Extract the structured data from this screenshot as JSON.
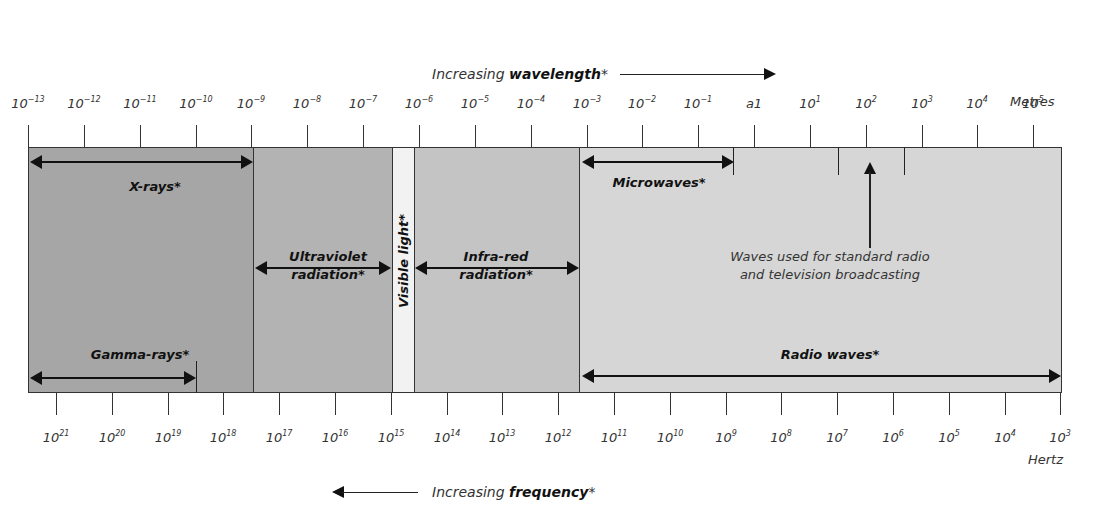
{
  "header": {
    "wavelength_caption_prefix": "Increasing ",
    "wavelength_caption_bold": "wavelength",
    "wavelength_caption_suffix": "*",
    "wavelength_unit": "Metres"
  },
  "footer": {
    "frequency_caption_prefix": "Increasing ",
    "frequency_caption_bold": "frequency",
    "frequency_caption_suffix": "*",
    "frequency_unit": "Hertz"
  },
  "wavelength_ticks": [
    {
      "base": "10",
      "exp": "−13"
    },
    {
      "base": "10",
      "exp": "−12"
    },
    {
      "base": "10",
      "exp": "−11"
    },
    {
      "base": "10",
      "exp": "−10"
    },
    {
      "base": "10",
      "exp": "−9"
    },
    {
      "base": "10",
      "exp": "−8"
    },
    {
      "base": "10",
      "exp": "−7"
    },
    {
      "base": "10",
      "exp": "−6"
    },
    {
      "base": "10",
      "exp": "−5"
    },
    {
      "base": "10",
      "exp": "−4"
    },
    {
      "base": "10",
      "exp": "−3"
    },
    {
      "base": "10",
      "exp": "−2"
    },
    {
      "base": "10",
      "exp": "−1"
    },
    {
      "base": "a1",
      "exp": ""
    },
    {
      "base": "10",
      "exp": "1"
    },
    {
      "base": "10",
      "exp": "2"
    },
    {
      "base": "10",
      "exp": "3"
    },
    {
      "base": "10",
      "exp": "4"
    },
    {
      "base": "10",
      "exp": "5"
    }
  ],
  "frequency_ticks": [
    {
      "base": "10",
      "exp": "21"
    },
    {
      "base": "10",
      "exp": "20"
    },
    {
      "base": "10",
      "exp": "19"
    },
    {
      "base": "10",
      "exp": "18"
    },
    {
      "base": "10",
      "exp": "17"
    },
    {
      "base": "10",
      "exp": "16"
    },
    {
      "base": "10",
      "exp": "15"
    },
    {
      "base": "10",
      "exp": "14"
    },
    {
      "base": "10",
      "exp": "13"
    },
    {
      "base": "10",
      "exp": "12"
    },
    {
      "base": "10",
      "exp": "11"
    },
    {
      "base": "10",
      "exp": "10"
    },
    {
      "base": "10",
      "exp": "9"
    },
    {
      "base": "10",
      "exp": "8"
    },
    {
      "base": "10",
      "exp": "7"
    },
    {
      "base": "10",
      "exp": "6"
    },
    {
      "base": "10",
      "exp": "5"
    },
    {
      "base": "10",
      "exp": "4"
    },
    {
      "base": "10",
      "exp": "3"
    }
  ],
  "bands": {
    "xrays": "X-rays*",
    "gamma": "Gamma-rays*",
    "uv_line1": "Ultraviolet",
    "uv_line2": "radiation*",
    "visible": "Visible light*",
    "ir_line1": "Infra-red",
    "ir_line2": "radiation*",
    "microwaves": "Microwaves*",
    "radio": "Radio waves*"
  },
  "annotation": {
    "line1": "Waves used for standard radio",
    "line2": "and television broadcasting"
  },
  "colors": {
    "xray_gamma": "#a6a6a6",
    "uv": "#b3b3b3",
    "visible": "#f2f2f2",
    "infrared": "#c4c4c4",
    "radio": "#d6d6d6",
    "lines": "#222222"
  }
}
